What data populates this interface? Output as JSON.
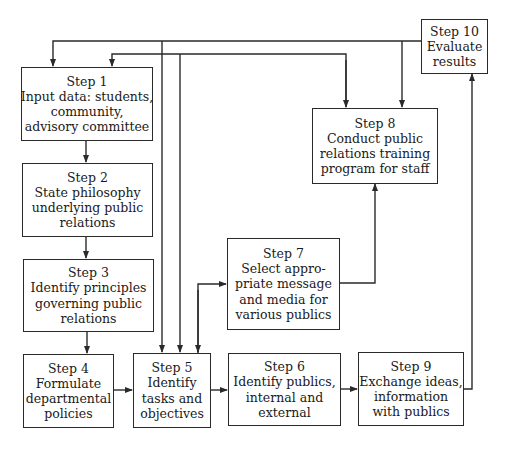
{
  "diagram": {
    "type": "flowchart",
    "line_color": "#2a2a2a",
    "steps": [
      {
        "id": "step1",
        "title": "Step 1",
        "lines": [
          "Input data: students,",
          "community,",
          "advisory committee"
        ]
      },
      {
        "id": "step2",
        "title": "Step 2",
        "lines": [
          "State philosophy",
          "underlying public",
          "relations"
        ]
      },
      {
        "id": "step3",
        "title": "Step 3",
        "lines": [
          "Identify principles",
          "governing public",
          "relations"
        ]
      },
      {
        "id": "step4",
        "title": "Step 4",
        "lines": [
          "Formulate",
          "departmental",
          "policies"
        ]
      },
      {
        "id": "step5",
        "title": "Step 5",
        "lines": [
          "Identify",
          "tasks and",
          "objectives"
        ]
      },
      {
        "id": "step6",
        "title": "Step 6",
        "lines": [
          "Identify publics,",
          "internal and",
          "external"
        ]
      },
      {
        "id": "step7",
        "title": "Step 7",
        "lines": [
          "Select appro-",
          "priate message",
          "and media for",
          "various publics"
        ]
      },
      {
        "id": "step8",
        "title": "Step 8",
        "lines": [
          "Conduct public",
          "relations training",
          "program for staff"
        ]
      },
      {
        "id": "step9",
        "title": "Step 9",
        "lines": [
          "Exchange ideas,",
          "information",
          "with publics"
        ]
      },
      {
        "id": "step10",
        "title": "Step 10",
        "lines": [
          "Evaluate",
          "results"
        ]
      }
    ],
    "connections": [
      {
        "from": "step1",
        "to": "step2"
      },
      {
        "from": "step2",
        "to": "step3"
      },
      {
        "from": "step3",
        "to": "step4"
      },
      {
        "from": "step4",
        "to": "step5"
      },
      {
        "from": "step5",
        "to": "step6"
      },
      {
        "from": "step5",
        "to": "step7"
      },
      {
        "from": "step7",
        "to": "step8"
      },
      {
        "from": "step6",
        "to": "step9"
      },
      {
        "from": "step9",
        "to": "step10"
      },
      {
        "from": "step10",
        "to": "step1"
      },
      {
        "from": "step10",
        "to": "step5"
      },
      {
        "from": "step10",
        "to": "step8"
      },
      {
        "from": "step10",
        "to": "step1",
        "via": "second feedback line"
      },
      {
        "from": "step10",
        "to": "step5",
        "via": "second feedback line"
      },
      {
        "from": "step10",
        "to": "step8",
        "via": "second feedback line"
      }
    ]
  }
}
